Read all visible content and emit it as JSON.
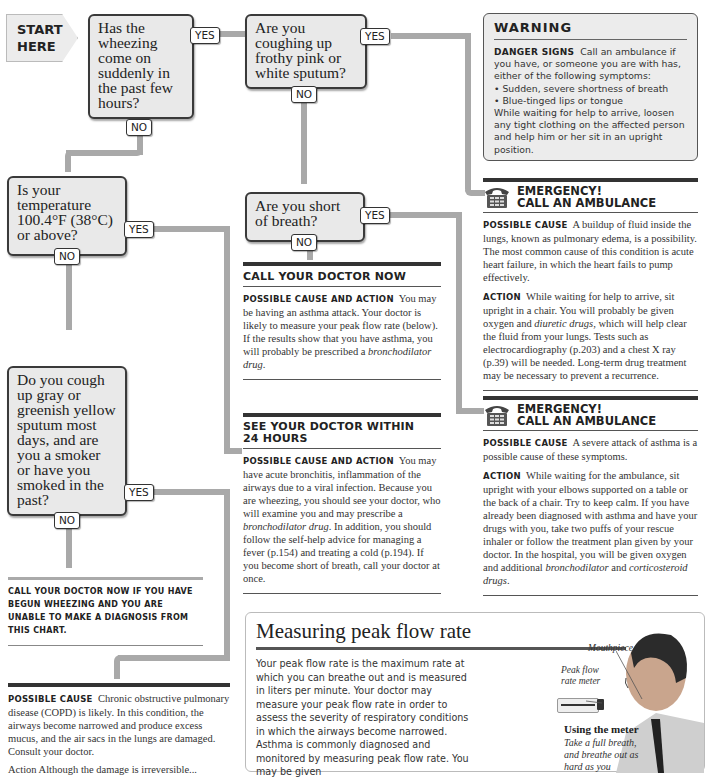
{
  "flowchart": {
    "start_label": "START HERE",
    "questions": [
      {
        "id": "q1",
        "text": "Has the wheezing come on suddenly in the past few hours?",
        "yes": "YES",
        "no": "NO"
      },
      {
        "id": "q2",
        "text": "Are you coughing up frothy pink or white sputum?",
        "yes": "YES",
        "no": "NO"
      },
      {
        "id": "q3",
        "text": "Is your temperature 100.4°F (38°C) or above?",
        "yes": "YES",
        "no": "NO"
      },
      {
        "id": "q4",
        "text": "Are you short of breath?",
        "yes": "YES",
        "no": "NO"
      },
      {
        "id": "q5",
        "text": "Do you cough up gray or greenish yellow sputum most days, and are you a smoker or have you smoked in the past?",
        "yes": "YES",
        "no": "NO"
      }
    ],
    "pipe_color": "#a9a9a9"
  },
  "warning": {
    "title": "WARNING",
    "lead": "Danger signs",
    "text": "Call an ambulance if you have, or someone you are with has, either of the following symptoms:",
    "bullets": [
      "Sudden, severe shortness of breath",
      "Blue-tinged lips or tongue"
    ],
    "after": "While waiting for help to arrive, loosen any tight clothing on the affected person and help him or her sit in an upright position."
  },
  "emergency1": {
    "title_line1": "EMERGENCY!",
    "title_line2": "CALL AN AMBULANCE",
    "cause_label": "Possible cause",
    "cause_text": "A buildup of fluid inside the lungs, known as pulmonary edema, is a possibility. The most common cause of this condition is acute heart failure, in which the heart fails to pump effectively.",
    "action_label": "Action",
    "action_pre": "While waiting for help to arrive, sit upright in a chair. You will probably be given oxygen and ",
    "action_italic": "diuretic drugs",
    "action_post": ", which will help clear the fluid from your lungs. Tests such as electrocardiography (p.203) and a chest X ray (p.39) will be needed. Long-term drug treatment may be necessary to prevent a recurrence."
  },
  "emergency2": {
    "title_line1": "EMERGENCY!",
    "title_line2": "CALL AN AMBULANCE",
    "cause_label": "Possible cause",
    "cause_text": "A severe attack of asthma is a possible cause of these symptoms.",
    "action_label": "Action",
    "action_pre": "While waiting for the ambulance, sit upright with your elbows supported on a table or the back of a chair. Try to keep calm. If you have already been diagnosed with asthma and have your drugs with you, take two puffs of your rescue inhaler or follow the treatment plan given by your doctor. In the hospital, you will be given oxygen and additional ",
    "action_italic1": "bronchodilator",
    "action_mid": " and ",
    "action_italic2": "corticosteroid drugs",
    "action_post": "."
  },
  "call_doctor_now": {
    "title": "CALL YOUR DOCTOR NOW",
    "label": "Possible cause and action",
    "text_pre": "You may be having an asthma attack. Your doctor is likely to measure your peak flow rate (below). If the results show that you have asthma, you will probably be prescribed a ",
    "text_italic": "bronchodilator drug",
    "text_post": "."
  },
  "see_doctor_24h": {
    "title_line1": "SEE YOUR DOCTOR WITHIN",
    "title_line2": "24 HOURS",
    "label": "Possible cause and action",
    "text_pre": "You may have acute bronchitis, inflammation of the airways due to a viral infection. Because you are wheezing, you should see your doctor, who will examine you and may prescribe a ",
    "text_italic": "bronchodilator drug",
    "text_post": ". In addition, you should follow the self-help advice for managing a fever (p.154) and treating a cold (p.194). If you become short of breath, call your doctor at once."
  },
  "fallback_note": "Call your doctor now if you have begun wheezing and you are unable to make a diagnosis from this chart.",
  "copd": {
    "cause_label": "Possible cause",
    "cause_text": "Chronic obstructive pulmonary disease (COPD) is likely. In this condition, the airways become narrowed and produce excess mucus, and the air sacs in the lungs are damaged. Consult your doctor.",
    "action_partial": "Action  Although the damage is irreversible..."
  },
  "peak_flow": {
    "title": "Measuring peak flow rate",
    "body": "Your peak flow rate is the maximum rate at which you can breathe out and is measured in liters per minute. Your doctor may measure your peak flow rate in order to assess the severity of respiratory conditions in which the airways become narrowed. Asthma is commonly diagnosed and monitored by measuring peak flow rate. You may be given",
    "callout_mouthpiece": "Mouthpiece",
    "callout_meter": "Peak flow rate meter",
    "using_title": "Using the meter",
    "using_text": "Take a full breath, and breathe out as hard as you"
  }
}
